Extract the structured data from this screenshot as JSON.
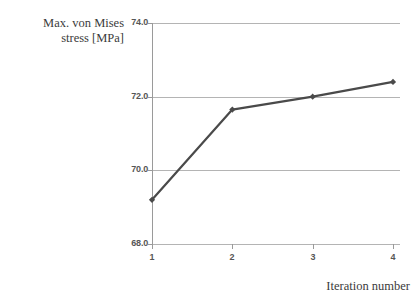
{
  "chart_data": {
    "type": "line",
    "title": "",
    "xlabel": "Iteration number",
    "ylabel": "Max. von Mises stress [MPa]",
    "ylabel_lines": [
      "Max. von Mises",
      "stress [MPa]"
    ],
    "x": [
      1,
      2,
      3,
      4
    ],
    "values": [
      69.2,
      71.65,
      72.0,
      72.4
    ],
    "series": [
      {
        "name": "Max. von Mises stress",
        "values": [
          69.2,
          71.65,
          72.0,
          72.4
        ],
        "color": "#4a4a4a",
        "marker": "diamond"
      }
    ],
    "xtick_labels": [
      "1",
      "2",
      "3",
      "4"
    ],
    "ytick_labels": [
      "74.0",
      "72.0",
      "70.0",
      "68.0"
    ],
    "ytick_values": [
      74.0,
      72.0,
      70.0,
      68.0
    ],
    "ylim": [
      68.0,
      74.0
    ],
    "xlim": [
      0.7,
      4.3
    ],
    "grid": "horizontal",
    "legend": "none",
    "gridline_color": "#b4b4b4",
    "axis_color": "#9a9a9a",
    "background": "#ffffff"
  },
  "axes": {
    "y_title_line1": "Max. von Mises",
    "y_title_line2": "stress [MPa]",
    "x_title": "Iteration number"
  }
}
